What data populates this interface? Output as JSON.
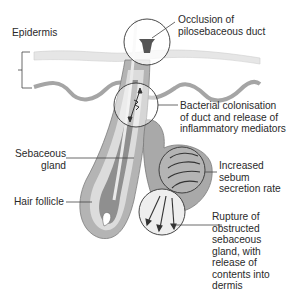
{
  "diagram": {
    "labels": {
      "epidermis": "Epidermis",
      "occlusion": "Occlusion of\npilosebaceous duct",
      "bacterial": "Bacterial colonisation\nof duct and release of\ninflammatory mediators",
      "sebaceous_gland": "Sebaceous\ngland",
      "hair_follicle": "Hair follicle",
      "sebum": "Increased\nsebum\nsecretion rate",
      "rupture": "Rupture of\nobstructed\nsebaceous\ngland, with\nrelease of\ncontents into\ndermis"
    },
    "colors": {
      "outline": "#3a3a3a",
      "skin_light": "#e2e2e2",
      "skin_dark": "#9a9a9a",
      "follicle_dark": "#8c8c8c",
      "follicle_light": "#d8d8d8",
      "gland": "#a8a8a8",
      "plug": "#555555"
    }
  }
}
